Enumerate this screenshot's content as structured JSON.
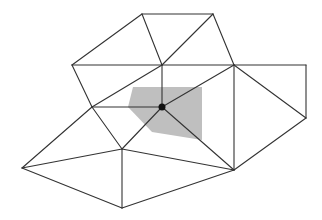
{
  "diagram": {
    "type": "triangulated mesh with shaded Voronoi/dual cell around central vertex",
    "colors": {
      "background": "#ffffff",
      "edge": "#333333",
      "shaded_cell": "#bfbfbf",
      "center_vertex": "#111111"
    },
    "vertices": {
      "A": [
        142,
        14
      ],
      "B": [
        213,
        14
      ],
      "C": [
        72,
        65
      ],
      "D": [
        162,
        65
      ],
      "E": [
        234,
        65
      ],
      "F": [
        306,
        65
      ],
      "G": [
        92,
        107
      ],
      "H": [
        162,
        107
      ],
      "I": [
        306,
        118
      ],
      "J": [
        22,
        168
      ],
      "K": [
        122,
        149
      ],
      "L": [
        234,
        170
      ],
      "M": [
        122,
        208
      ]
    },
    "edges": [
      [
        "A",
        "B"
      ],
      [
        "A",
        "C"
      ],
      [
        "A",
        "D"
      ],
      [
        "B",
        "D"
      ],
      [
        "B",
        "E"
      ],
      [
        "C",
        "D"
      ],
      [
        "C",
        "G"
      ],
      [
        "D",
        "E"
      ],
      [
        "E",
        "F"
      ],
      [
        "F",
        "I"
      ],
      [
        "D",
        "H"
      ],
      [
        "E",
        "H"
      ],
      [
        "E",
        "I"
      ],
      [
        "E",
        "L"
      ],
      [
        "I",
        "L"
      ],
      [
        "G",
        "D"
      ],
      [
        "G",
        "H"
      ],
      [
        "G",
        "J"
      ],
      [
        "G",
        "K"
      ],
      [
        "H",
        "K"
      ],
      [
        "H",
        "L"
      ],
      [
        "J",
        "K"
      ],
      [
        "J",
        "M"
      ],
      [
        "K",
        "M"
      ],
      [
        "K",
        "L"
      ],
      [
        "M",
        "L"
      ]
    ],
    "shaded_cell": [
      [
        128,
        107
      ],
      [
        133,
        87
      ],
      [
        202,
        87
      ],
      [
        202,
        140
      ],
      [
        152,
        132
      ]
    ],
    "center_vertex": {
      "id": "H",
      "radius": 3.5
    }
  }
}
